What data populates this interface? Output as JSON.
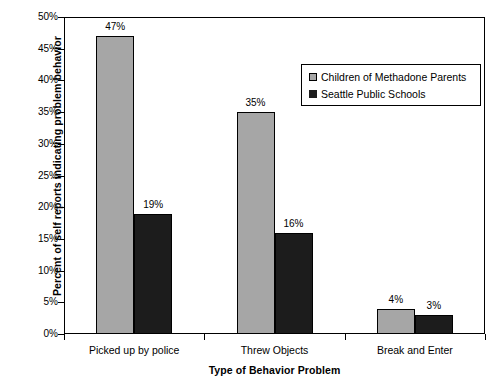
{
  "chart_data": {
    "type": "bar",
    "title": "",
    "xlabel": "Type of Behavior Problem",
    "ylabel": "Percent of self reports indicating problem behavior",
    "categories": [
      "Picked up by police",
      "Threw Objects",
      "Break and Enter"
    ],
    "series": [
      {
        "name": "Children of Methadone Parents",
        "color": "#a6a6a6",
        "values": [
          47,
          35,
          4
        ],
        "value_labels": [
          "47%",
          "35%",
          "4%"
        ]
      },
      {
        "name": "Seattle Public Schools",
        "color": "#1c1c1c",
        "values": [
          19,
          16,
          3
        ],
        "value_labels": [
          "19%",
          "16%",
          "3%"
        ]
      }
    ],
    "ylim": [
      0,
      50
    ],
    "ytick_step": 5,
    "ytick_labels": [
      "50%",
      "45%",
      "40%",
      "35%",
      "30%",
      "25%",
      "20%",
      "15%",
      "10%",
      "5%",
      "0%"
    ],
    "ytick_values": [
      50,
      45,
      40,
      35,
      30,
      25,
      20,
      15,
      10,
      5,
      0
    ],
    "grid": false,
    "legend_position": "top-right",
    "legend_entries": [
      "Children of Methadone Parents",
      "Seattle Public Schools"
    ]
  }
}
